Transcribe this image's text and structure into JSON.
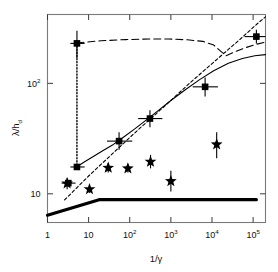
{
  "chart_data": {
    "type": "scatter",
    "title": "",
    "xlabel": "1/γ",
    "ylabel": "λ/h_d",
    "xscale": "log",
    "yscale": "log",
    "xlim": [
      1,
      200000
    ],
    "ylim": [
      5.5,
      420
    ],
    "grid": false,
    "legend": "none",
    "xticks": [
      {
        "value": 1,
        "label": "1",
        "sup": ""
      },
      {
        "value": 10,
        "label": "10",
        "sup": ""
      },
      {
        "value": 100,
        "label": "10",
        "sup": "2"
      },
      {
        "value": 1000,
        "label": "10",
        "sup": "3"
      },
      {
        "value": 10000,
        "label": "10",
        "sup": "4"
      },
      {
        "value": 100000,
        "label": "10",
        "sup": "5"
      }
    ],
    "yticks": [
      {
        "value": 10,
        "label": "10",
        "sup": ""
      },
      {
        "value": 100,
        "label": "10",
        "sup": "2"
      }
    ],
    "series": [
      {
        "name": "squares",
        "marker": "square",
        "color": "#000000",
        "points": [
          {
            "x": 3.2,
            "y": 12.5,
            "xerr_lo": 2.2,
            "xerr_hi": 4.8,
            "yerr_lo": 0,
            "yerr_hi": 0
          },
          {
            "x": 5.2,
            "y": 17.5,
            "xerr_lo": 3.6,
            "xerr_hi": 8.0,
            "yerr_lo": 0,
            "yerr_hi": 0
          },
          {
            "x": 5.2,
            "y": 230,
            "xerr_lo": 3.6,
            "xerr_hi": 8.0,
            "yerr_lo": 170,
            "yerr_hi": 300
          },
          {
            "x": 55,
            "y": 30,
            "xerr_lo": 28,
            "xerr_hi": 115,
            "yerr_lo": 25,
            "yerr_hi": 36
          },
          {
            "x": 310,
            "y": 48,
            "xerr_lo": 160,
            "xerr_hi": 620,
            "yerr_lo": 40,
            "yerr_hi": 57
          },
          {
            "x": 6800,
            "y": 93,
            "xerr_lo": 3400,
            "xerr_hi": 14000,
            "yerr_lo": 76,
            "yerr_hi": 113
          },
          {
            "x": 120000,
            "y": 265,
            "xerr_lo": 62000,
            "xerr_hi": 200000,
            "yerr_lo": 230,
            "yerr_hi": 305
          }
        ]
      },
      {
        "name": "stars",
        "marker": "star",
        "color": "#000000",
        "points": [
          {
            "x": 3.0,
            "y": 12.4,
            "yerr_lo": 11.0,
            "yerr_hi": 14.0
          },
          {
            "x": 10.5,
            "y": 11.0,
            "yerr_lo": 10.2,
            "yerr_hi": 11.9
          },
          {
            "x": 30,
            "y": 17.2,
            "yerr_lo": 15.6,
            "yerr_hi": 19.0
          },
          {
            "x": 90,
            "y": 17.0,
            "yerr_lo": 15.6,
            "yerr_hi": 18.5
          },
          {
            "x": 320,
            "y": 19.5,
            "yerr_lo": 17.0,
            "yerr_hi": 22.5
          },
          {
            "x": 1000,
            "y": 13.0,
            "yerr_lo": 10.5,
            "yerr_hi": 16.2
          },
          {
            "x": 13000,
            "y": 28.0,
            "yerr_lo": 21.0,
            "yerr_hi": 36.0
          }
        ]
      }
    ],
    "curves": [
      {
        "name": "solid-model-curve",
        "style": "solid",
        "color": "#000000",
        "width": 1.1,
        "points": [
          {
            "x": 5.2,
            "y": 17.6
          },
          {
            "x": 8,
            "y": 19.5
          },
          {
            "x": 13,
            "y": 21.8
          },
          {
            "x": 22,
            "y": 24.5
          },
          {
            "x": 40,
            "y": 28.0
          },
          {
            "x": 70,
            "y": 32.5
          },
          {
            "x": 130,
            "y": 38.5
          },
          {
            "x": 250,
            "y": 46.5
          },
          {
            "x": 500,
            "y": 57.0
          },
          {
            "x": 1000,
            "y": 70.0
          },
          {
            "x": 2200,
            "y": 87.0
          },
          {
            "x": 5000,
            "y": 108
          },
          {
            "x": 11000,
            "y": 130
          },
          {
            "x": 25000,
            "y": 152
          },
          {
            "x": 55000,
            "y": 168
          },
          {
            "x": 110000,
            "y": 178
          },
          {
            "x": 200000,
            "y": 182
          }
        ]
      },
      {
        "name": "short-dashed-power-law",
        "style": "dashed-short",
        "color": "#000000",
        "width": 1.1,
        "points": [
          {
            "x": 2.6,
            "y": 8.8
          },
          {
            "x": 10,
            "y": 14.5
          },
          {
            "x": 40,
            "y": 23.5
          },
          {
            "x": 160,
            "y": 38.0
          },
          {
            "x": 700,
            "y": 62.0
          },
          {
            "x": 3000,
            "y": 102
          },
          {
            "x": 12000,
            "y": 160
          },
          {
            "x": 45000,
            "y": 245
          },
          {
            "x": 130000,
            "y": 350
          },
          {
            "x": 200000,
            "y": 400
          }
        ]
      },
      {
        "name": "long-dashed-plateau-curve",
        "style": "dashed-long",
        "color": "#000000",
        "width": 1.1,
        "points": [
          {
            "x": 5.2,
            "y": 232
          },
          {
            "x": 20,
            "y": 243
          },
          {
            "x": 80,
            "y": 249
          },
          {
            "x": 300,
            "y": 252
          },
          {
            "x": 900,
            "y": 252
          },
          {
            "x": 2500,
            "y": 248
          },
          {
            "x": 6000,
            "y": 240
          },
          {
            "x": 11000,
            "y": 222
          },
          {
            "x": 17000,
            "y": 193
          },
          {
            "x": 22000,
            "y": 178
          },
          {
            "x": 35000,
            "y": 192
          },
          {
            "x": 60000,
            "y": 208
          },
          {
            "x": 110000,
            "y": 224
          },
          {
            "x": 200000,
            "y": 236
          }
        ]
      },
      {
        "name": "vertical-dotted-errorbar",
        "style": "dotted",
        "color": "#000000",
        "width": 1.4,
        "points": [
          {
            "x": 5.2,
            "y": 232
          },
          {
            "x": 5.2,
            "y": 17.6
          }
        ]
      },
      {
        "name": "thick-bound-line",
        "style": "solid-thick",
        "color": "#000000",
        "width": 3.2,
        "points": [
          {
            "x": 1,
            "y": 6.4
          },
          {
            "x": 18,
            "y": 8.85
          },
          {
            "x": 120000,
            "y": 8.85
          }
        ]
      }
    ]
  }
}
